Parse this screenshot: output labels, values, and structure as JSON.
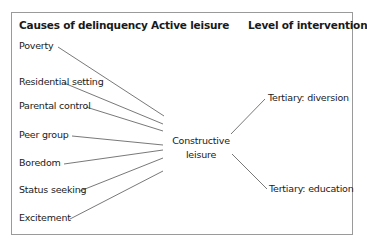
{
  "headers": {
    "causes": "Causes of delinquency",
    "active": "Active leisure",
    "level": "Level of intervention"
  },
  "causes": [
    {
      "label": "Poverty"
    },
    {
      "label": "Residential setting"
    },
    {
      "label": "Parental control"
    },
    {
      "label": "Peer group"
    },
    {
      "label": "Boredom"
    },
    {
      "label": "Status seeking"
    },
    {
      "label": "Excitement"
    }
  ],
  "center": {
    "line1": "Constructive",
    "line2": "leisure"
  },
  "interventions": [
    {
      "label": "Tertiary: diversion"
    },
    {
      "label": "Tertiary: education"
    }
  ],
  "colors": {
    "line": "#555555",
    "border": "#9a9a9a",
    "text": "#1a1a1a"
  }
}
